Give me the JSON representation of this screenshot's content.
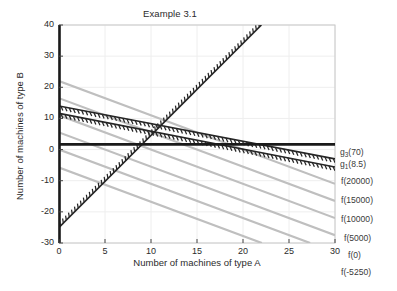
{
  "chart_data": {
    "type": "line",
    "title": "Example 3.1",
    "xlabel": "Number of machines of type A",
    "ylabel": "Number of machines of type B",
    "xlim": [
      0,
      30
    ],
    "ylim": [
      -30,
      40
    ],
    "xticks": [
      0,
      5,
      10,
      15,
      20,
      25,
      30
    ],
    "yticks": [
      -30,
      -20,
      -10,
      0,
      10,
      20,
      30,
      40
    ],
    "xtick_labels": [
      "0",
      "5",
      "10",
      "15",
      "20",
      "25",
      "30"
    ],
    "ytick_labels": [
      "-30",
      "-20",
      "-10",
      "0",
      "10",
      "20",
      "30",
      "40"
    ],
    "grid": true,
    "legend_position": "right-outside",
    "series": [
      {
        "name": "g3(70)",
        "style": "hatched-constraint",
        "color": "#262626",
        "hatch_side": "below",
        "points": [
          [
            0,
            14.0
          ],
          [
            30,
            -3.0
          ]
        ],
        "slope": -0.5667,
        "intercept": 14.0,
        "label": "g<sub>3</sub>(70)"
      },
      {
        "name": "g1(8.5)",
        "style": "hatched-constraint",
        "color": "#262626",
        "hatch_side": "below",
        "points": [
          [
            0,
            11.6
          ],
          [
            30,
            -5.6
          ]
        ],
        "slope": -0.5733,
        "intercept": 11.6,
        "label": "g<sub>1</sub>(8.5)"
      },
      {
        "name": "g2",
        "style": "hatched-constraint",
        "color": "#262626",
        "hatch_side": "above-left",
        "points": [
          [
            0,
            -25.0
          ],
          [
            22,
            40.0
          ]
        ],
        "slope": 2.9545,
        "intercept": -25.0,
        "label": ""
      },
      {
        "name": "f(20000)",
        "style": "objective-contour",
        "color": "#bfbfbf",
        "points": [
          [
            0,
            22.0
          ],
          [
            30,
            -11.0
          ]
        ],
        "slope": -1.1,
        "intercept": 22.0,
        "label": "f(20000)"
      },
      {
        "name": "f(15000)",
        "style": "objective-contour",
        "color": "#bfbfbf",
        "points": [
          [
            0,
            16.5
          ],
          [
            30,
            -16.5
          ]
        ],
        "slope": -1.1,
        "intercept": 16.5,
        "label": "f(15000)"
      },
      {
        "name": "f(10000)",
        "style": "objective-contour",
        "color": "#bfbfbf",
        "points": [
          [
            0,
            11.0
          ],
          [
            30,
            -22.0
          ]
        ],
        "slope": -1.1,
        "intercept": 11.0,
        "label": "f(10000)"
      },
      {
        "name": "f(5000)",
        "style": "objective-contour",
        "color": "#bfbfbf",
        "points": [
          [
            0,
            5.5
          ],
          [
            30,
            -27.5
          ]
        ],
        "slope": -1.1,
        "intercept": 5.5,
        "label": "f(5000)"
      },
      {
        "name": "f(0)",
        "style": "objective-contour",
        "color": "#bfbfbf",
        "points": [
          [
            0,
            0.0
          ],
          [
            27.3,
            -30.0
          ]
        ],
        "slope": -1.1,
        "intercept": 0.0,
        "label": "f(0)"
      },
      {
        "name": "f(-5250)",
        "style": "objective-contour",
        "color": "#bfbfbf",
        "points": [
          [
            0,
            -5.75
          ],
          [
            22.05,
            -30.0
          ]
        ],
        "slope": -1.1,
        "intercept": -5.75,
        "label": "f(-5250)"
      }
    ],
    "axis_lines": {
      "x_axis_at_y0": true,
      "y_axis_at_x0": true,
      "color": "#1a1a1a"
    }
  },
  "legend": {
    "entries": [
      {
        "id": "g3",
        "text": "g3(70)",
        "base": "g",
        "sub": "3",
        "arg": "(70)"
      },
      {
        "id": "g1",
        "text": "g1(8.5)",
        "base": "g",
        "sub": "1",
        "arg": "(8.5)"
      },
      {
        "id": "f20000",
        "text": "f(20000)"
      },
      {
        "id": "f15000",
        "text": "f(15000)"
      },
      {
        "id": "f10000",
        "text": "f(10000)"
      },
      {
        "id": "f5000",
        "text": "f(5000)"
      },
      {
        "id": "f0",
        "text": "f(0)"
      },
      {
        "id": "fneg5250",
        "text": "f(-5250)"
      }
    ]
  },
  "colors": {
    "background": "#ffffff",
    "axis": "#1a1a1a",
    "grid": "#eeeeee",
    "constraint": "#262626",
    "contour": "#bfbfbf",
    "text": "#2b2b2b"
  }
}
